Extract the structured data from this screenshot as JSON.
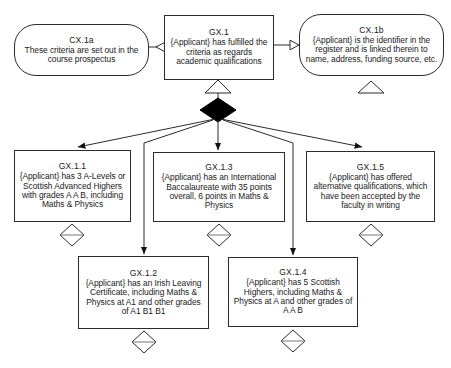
{
  "diagram": {
    "type": "gsn-goal-structuring-notation",
    "stroke_color": "#2b2b2b",
    "fill_color": "#ffffff",
    "solid_diamond_color": "#000000"
  },
  "nodes": {
    "cx1a": {
      "id": "CX.1a",
      "kind": "context",
      "text": "These criteria are set out in the course prospectus",
      "x": 14,
      "y": 24,
      "w": 135,
      "h": 52
    },
    "gx1": {
      "id": "GX.1",
      "kind": "goal",
      "text": "{Applicant} has fulfilled the criteria as regards academic qualifications",
      "x": 164,
      "y": 15,
      "w": 110,
      "h": 65
    },
    "cx1b": {
      "id": "CX.1b",
      "kind": "context",
      "text": "{Applicant} is the identifier in the register and is linked therein to name, address, funding source, etc.",
      "x": 299,
      "y": 14,
      "w": 145,
      "h": 62
    },
    "gx11": {
      "id": "GX.1.1",
      "kind": "goal",
      "text": "{Applicant} has 3 A-Levels or Scottish Advanced Highers with grades A A B, including Maths & Physics",
      "x": 14,
      "y": 150,
      "w": 117,
      "h": 72
    },
    "gx13": {
      "id": "GX.1.3",
      "kind": "goal",
      "text": "{Applicant} has an International Baccalaureate with 35 points overall, 6 points in Maths & Physics",
      "x": 153,
      "y": 152,
      "w": 132,
      "h": 70
    },
    "gx15": {
      "id": "GX.1.5",
      "kind": "goal",
      "text": "{Applicant} has offered alternative qualifications, which have been accepted by the faculty in writing",
      "x": 306,
      "y": 151,
      "w": 129,
      "h": 71
    },
    "gx12": {
      "id": "GX.1.2",
      "kind": "goal",
      "text": "{Applicant} has an Irish Leaving Certificate, including Maths & Physics at A1 and other grades of A1 B1 B1",
      "x": 78,
      "y": 256,
      "w": 131,
      "h": 73
    },
    "gx14": {
      "id": "GX.1.4",
      "kind": "goal",
      "text": "{Applicant} has 5 Scottish Highers, including Maths & Physics at A and other grades of A A B",
      "x": 228,
      "y": 257,
      "w": 130,
      "h": 70
    }
  },
  "connectors": {
    "gx1_to_cx1a": {
      "label": "in-context-of",
      "arrowhead": "hollow-triangle-left"
    },
    "gx1_to_cx1b": {
      "label": "in-context-of",
      "arrowhead": "hollow-triangle-right"
    },
    "gx1_undeveloped_up": {
      "label": "hollow-triangle-up-under-gx1"
    },
    "choice_node": {
      "label": "solid-diamond-choice",
      "x": 218,
      "y": 110
    },
    "edges_from_choice": [
      {
        "to": "GX.1.1",
        "arrowhead": "solid-arrow"
      },
      {
        "to": "GX.1.2",
        "arrowhead": "solid-arrow"
      },
      {
        "to": "GX.1.3",
        "arrowhead": "solid-arrow"
      },
      {
        "to": "GX.1.4",
        "arrowhead": "solid-arrow"
      },
      {
        "to": "GX.1.5",
        "arrowhead": "solid-arrow"
      }
    ]
  },
  "markers": {
    "cx1b_triangle": {
      "shape": "hollow-triangle-up",
      "x": 371,
      "y": 87
    },
    "gx11_diamond": {
      "shape": "hollow-diamond-with-bar",
      "x": 72,
      "y": 235
    },
    "gx13_diamond": {
      "shape": "hollow-diamond-with-bar",
      "x": 219,
      "y": 235
    },
    "gx15_diamond": {
      "shape": "hollow-diamond-with-bar",
      "x": 371,
      "y": 235
    },
    "gx12_diamond": {
      "shape": "hollow-diamond-with-bar",
      "x": 144,
      "y": 342
    },
    "gx14_diamond": {
      "shape": "hollow-diamond-with-bar",
      "x": 293,
      "y": 341
    }
  }
}
